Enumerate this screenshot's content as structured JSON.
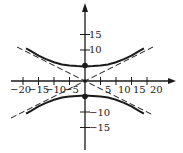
{
  "figure": {
    "x_axis": {
      "tick_labels": [
        "−20",
        "−15",
        "−10",
        "−5",
        "5",
        "10",
        "15",
        "20"
      ],
      "tick_values": [
        -20,
        -15,
        -10,
        -5,
        5,
        10,
        15,
        20
      ]
    },
    "y_axis": {
      "tick_labels": [
        "15",
        "10",
        "−10",
        "−15"
      ],
      "tick_values": [
        15,
        10,
        -10,
        -15
      ]
    },
    "vertices": [
      [
        0,
        5
      ],
      [
        0,
        -5
      ]
    ],
    "asymptotes": [
      "y = x/2",
      "y = -x/2"
    ],
    "colors": {
      "ink": "#1a1a1a",
      "background": "#ffffff"
    }
  }
}
